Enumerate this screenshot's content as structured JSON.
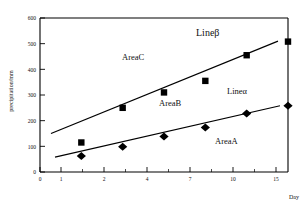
{
  "chart_data": {
    "type": "scatter",
    "title": "",
    "subtitle": "",
    "xlabel": "Day",
    "ylabel": "precipitation/mm",
    "grid": false,
    "legend_position": "none",
    "x_tick_labels": [
      "0",
      "1",
      "2",
      "4",
      "7",
      "10",
      "15"
    ],
    "x_category_values": [
      0,
      1,
      2,
      4,
      7,
      10,
      15
    ],
    "y_tick_labels": [
      "0",
      "100",
      "200",
      "300",
      "400",
      "500",
      "600"
    ],
    "y_tick_values": [
      0,
      100,
      200,
      300,
      400,
      500,
      600
    ],
    "ylim": [
      0,
      600
    ],
    "categories": [
      1,
      2,
      4,
      7,
      10,
      15
    ],
    "series": [
      {
        "name": "Lineβ",
        "marker": "square",
        "color": "#000000",
        "values": [
          115,
          250,
          310,
          355,
          455,
          508
        ],
        "fit_start": 150,
        "fit_end": 510
      },
      {
        "name": "Lineα",
        "marker": "diamond",
        "color": "#000000",
        "values": [
          62,
          98,
          138,
          173,
          228,
          258
        ],
        "fit_start": 58,
        "fit_end": 258
      }
    ],
    "annotations": [
      {
        "text": "Lineβ",
        "kind": "line-label"
      },
      {
        "text": "Lineα",
        "kind": "line-label"
      },
      {
        "text": "AreaA",
        "kind": "area-label"
      },
      {
        "text": "AreaB",
        "kind": "area-label"
      },
      {
        "text": "AreaC",
        "kind": "area-label"
      }
    ]
  },
  "axes": {
    "y_title": "precipitation/mm",
    "x_title": "Day",
    "y_ticks": [
      "600",
      "500",
      "400",
      "300",
      "200",
      "100",
      "0"
    ],
    "x_ticks": [
      "0",
      "1",
      "2",
      "4",
      "7",
      "10",
      "15"
    ]
  },
  "labels": {
    "line_beta": "Lineβ",
    "line_alpha": "Lineα",
    "area_a": "AreaA",
    "area_b": "AreaB",
    "area_c": "AreaC"
  },
  "colors": {
    "ink": "#000000",
    "background": "#ffffff"
  }
}
